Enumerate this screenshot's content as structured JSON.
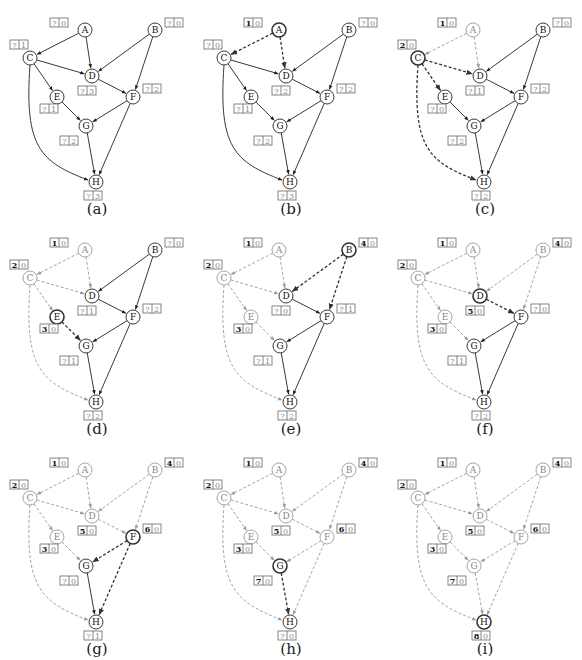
{
  "figure": {
    "colors": {
      "active": "#222222",
      "current": "#333333",
      "visited": "#9a9a9a",
      "box_border": "#666666",
      "bold_text": "#111111",
      "faded_text": "#888888"
    },
    "nodes": {
      "A": {
        "x": 85,
        "y": 30,
        "box": [
          50,
          18
        ]
      },
      "B": {
        "x": 155,
        "y": 30,
        "box": [
          165,
          18
        ]
      },
      "C": {
        "x": 30,
        "y": 58,
        "box": [
          10,
          40
        ]
      },
      "D": {
        "x": 92,
        "y": 76,
        "box": [
          78,
          86
        ]
      },
      "E": {
        "x": 57,
        "y": 97,
        "box": [
          40,
          104
        ]
      },
      "F": {
        "x": 133,
        "y": 97,
        "box": [
          143,
          84
        ]
      },
      "G": {
        "x": 86,
        "y": 126,
        "box": [
          60,
          136
        ]
      },
      "H": {
        "x": 96,
        "y": 182,
        "box": [
          84,
          191
        ]
      }
    },
    "edges": [
      {
        "from": "A",
        "to": "C"
      },
      {
        "from": "A",
        "to": "D"
      },
      {
        "from": "B",
        "to": "D"
      },
      {
        "from": "B",
        "to": "F"
      },
      {
        "from": "C",
        "to": "D"
      },
      {
        "from": "C",
        "to": "E"
      },
      {
        "from": "C",
        "to": "H",
        "curve": true
      },
      {
        "from": "D",
        "to": "F"
      },
      {
        "from": "E",
        "to": "G"
      },
      {
        "from": "F",
        "to": "G"
      },
      {
        "from": "F",
        "to": "H"
      },
      {
        "from": "G",
        "to": "H"
      }
    ],
    "panels": [
      {
        "caption": "(a)",
        "current": null,
        "visited": [],
        "boxes": {
          "A": [
            "?",
            "0"
          ],
          "B": [
            "?",
            "0"
          ],
          "C": [
            "?",
            "1"
          ],
          "D": [
            "?",
            "3"
          ],
          "E": [
            "?",
            "1"
          ],
          "F": [
            "?",
            "2"
          ],
          "G": [
            "?",
            "2"
          ],
          "H": [
            "?",
            "3"
          ]
        }
      },
      {
        "caption": "(b)",
        "current": "A",
        "visited": [],
        "boxes": {
          "A": [
            "1",
            "0"
          ],
          "B": [
            "?",
            "0"
          ],
          "C": [
            "?",
            "0"
          ],
          "D": [
            "?",
            "2"
          ],
          "E": [
            "?",
            "1"
          ],
          "F": [
            "?",
            "2"
          ],
          "G": [
            "?",
            "2"
          ],
          "H": [
            "?",
            "3"
          ]
        }
      },
      {
        "caption": "(c)",
        "current": "C",
        "visited": [
          "A"
        ],
        "boxes": {
          "A": [
            "1",
            "0"
          ],
          "B": [
            "?",
            "0"
          ],
          "C": [
            "2",
            "0"
          ],
          "D": [
            "?",
            "1"
          ],
          "E": [
            "?",
            "0"
          ],
          "F": [
            "?",
            "2"
          ],
          "G": [
            "?",
            "2"
          ],
          "H": [
            "?",
            "2"
          ]
        }
      },
      {
        "caption": "(d)",
        "current": "E",
        "visited": [
          "A",
          "C"
        ],
        "boxes": {
          "A": [
            "1",
            "0"
          ],
          "B": [
            "?",
            "0"
          ],
          "C": [
            "2",
            "0"
          ],
          "D": [
            "?",
            "1"
          ],
          "E": [
            "3",
            "0"
          ],
          "F": [
            "?",
            "2"
          ],
          "G": [
            "?",
            "1"
          ],
          "H": [
            "?",
            "2"
          ]
        }
      },
      {
        "caption": "(e)",
        "current": "B",
        "visited": [
          "A",
          "C",
          "E"
        ],
        "boxes": {
          "A": [
            "1",
            "0"
          ],
          "B": [
            "4",
            "0"
          ],
          "C": [
            "2",
            "0"
          ],
          "D": [
            "?",
            "0"
          ],
          "E": [
            "3",
            "0"
          ],
          "F": [
            "?",
            "1"
          ],
          "G": [
            "?",
            "1"
          ],
          "H": [
            "?",
            "2"
          ]
        }
      },
      {
        "caption": "(f)",
        "current": "D",
        "visited": [
          "A",
          "C",
          "E",
          "B"
        ],
        "boxes": {
          "A": [
            "1",
            "0"
          ],
          "B": [
            "4",
            "0"
          ],
          "C": [
            "2",
            "0"
          ],
          "D": [
            "5",
            "0"
          ],
          "E": [
            "3",
            "0"
          ],
          "F": [
            "?",
            "0"
          ],
          "G": [
            "?",
            "1"
          ],
          "H": [
            "?",
            "2"
          ]
        }
      },
      {
        "caption": "(g)",
        "current": "F",
        "visited": [
          "A",
          "C",
          "E",
          "B",
          "D"
        ],
        "boxes": {
          "A": [
            "1",
            "0"
          ],
          "B": [
            "4",
            "0"
          ],
          "C": [
            "2",
            "0"
          ],
          "D": [
            "5",
            "0"
          ],
          "E": [
            "3",
            "0"
          ],
          "F": [
            "6",
            "0"
          ],
          "G": [
            "?",
            "0"
          ],
          "H": [
            "?",
            "1"
          ]
        }
      },
      {
        "caption": "(h)",
        "current": "G",
        "visited": [
          "A",
          "C",
          "E",
          "B",
          "D",
          "F"
        ],
        "boxes": {
          "A": [
            "1",
            "0"
          ],
          "B": [
            "4",
            "0"
          ],
          "C": [
            "2",
            "0"
          ],
          "D": [
            "5",
            "0"
          ],
          "E": [
            "3",
            "0"
          ],
          "F": [
            "6",
            "0"
          ],
          "G": [
            "7",
            "0"
          ],
          "H": [
            "?",
            "0"
          ]
        }
      },
      {
        "caption": "(i)",
        "current": "H",
        "visited": [
          "A",
          "C",
          "E",
          "B",
          "D",
          "F",
          "G"
        ],
        "boxes": {
          "A": [
            "1",
            "0"
          ],
          "B": [
            "4",
            "0"
          ],
          "C": [
            "2",
            "0"
          ],
          "D": [
            "5",
            "0"
          ],
          "E": [
            "3",
            "0"
          ],
          "F": [
            "6",
            "0"
          ],
          "G": [
            "7",
            "0"
          ],
          "H": [
            "8",
            "0"
          ]
        }
      }
    ]
  }
}
